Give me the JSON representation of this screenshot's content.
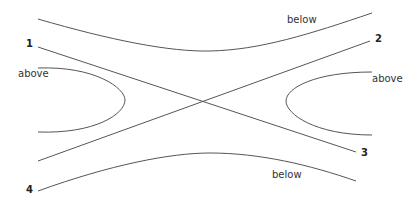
{
  "diagram": {
    "type": "hyperbola-asymptote-diagram",
    "region_labels": {
      "top": "below",
      "left": "above",
      "right": "above",
      "bottom": "below"
    },
    "line_labels": {
      "l1": "1",
      "l2": "2",
      "l3": "3",
      "l4": "4"
    },
    "stroke_color": "#555555"
  }
}
